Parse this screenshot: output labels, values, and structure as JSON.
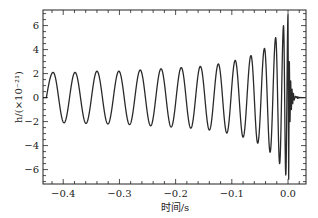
{
  "chart_data": {
    "type": "line",
    "title": "",
    "xlabel": "时间/s",
    "ylabel": "h/(×10⁻²¹)",
    "xlim": [
      -0.436,
      0.032
    ],
    "ylim": [
      -7.2,
      7.3
    ],
    "xticks": [
      -0.4,
      -0.3,
      -0.2,
      -0.1,
      0.0
    ],
    "xtick_labels": [
      "−0.4",
      "−0.3",
      "−0.2",
      "−0.1",
      "0.0"
    ],
    "yticks": [
      -6,
      -4,
      -2,
      0,
      2,
      4,
      6
    ],
    "ytick_labels": [
      "−6",
      "−4",
      "−2",
      "0",
      "2",
      "4",
      "6"
    ],
    "grid": false,
    "legend": null,
    "series": [
      {
        "name": "gravitational-wave strain (chirp)",
        "description": "Inspiral chirp: oscillation with increasing frequency and amplitude, peaking near t=0 then ringdown",
        "start_t": -0.43,
        "merger_t": 0.0,
        "start_amplitude": 2.1,
        "peak_amplitude": 6.9,
        "min_value": -6.8,
        "peaks_t": [
          -0.418,
          -0.379,
          -0.34,
          -0.301,
          -0.263,
          -0.226,
          -0.19,
          -0.156,
          -0.124,
          -0.094,
          -0.066,
          -0.042,
          -0.022,
          -0.008,
          0.0
        ],
        "peaks_h": [
          2.1,
          2.1,
          2.2,
          2.2,
          2.3,
          2.4,
          2.5,
          2.6,
          2.8,
          3.1,
          3.5,
          4.1,
          5.0,
          6.0,
          6.9
        ],
        "color": "#222222"
      }
    ]
  }
}
